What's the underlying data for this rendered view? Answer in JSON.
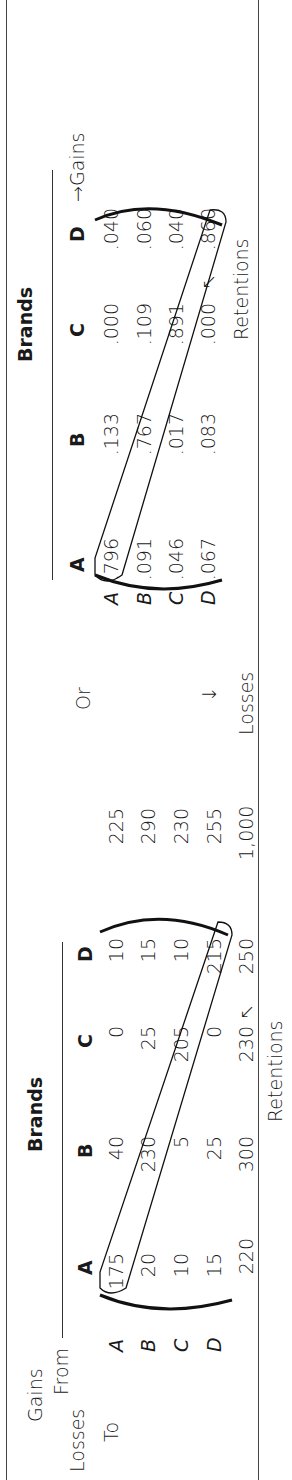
{
  "left_table": {
    "gains_label": "Gains",
    "from_label": "From",
    "losses_label": "Losses",
    "to_label": "To",
    "brands_label": "Brands",
    "column_headers": [
      "A",
      "B",
      "C",
      "D"
    ],
    "row_labels": [
      "A",
      "B",
      "C",
      "D"
    ],
    "rows": [
      {
        "values": [
          "175",
          "40",
          "0",
          "10"
        ],
        "total": "225"
      },
      {
        "values": [
          "20",
          "230",
          "25",
          "15"
        ],
        "total": "290"
      },
      {
        "values": [
          "10",
          "5",
          "205",
          "10"
        ],
        "total": "230"
      },
      {
        "values": [
          "15",
          "25",
          "0",
          "215"
        ],
        "total": "255"
      }
    ],
    "column_totals": [
      "220",
      "300",
      "230",
      "250"
    ],
    "grand_total": "1,000",
    "retentions_label": "Retentions",
    "retentions_arrow": "↖"
  },
  "connector": {
    "or_label": "Or",
    "losses_arrow": "↓",
    "losses_label": "Losses"
  },
  "right_table": {
    "brands_label": "Brands",
    "column_headers": [
      "A",
      "B",
      "C",
      "D"
    ],
    "gains_label": "→Gains",
    "row_labels": [
      "A",
      "B",
      "C",
      "D"
    ],
    "rows": [
      {
        "values": [
          ".796",
          ".133",
          ".000",
          ".040"
        ]
      },
      {
        "values": [
          ".091",
          ".767",
          ".109",
          ".060"
        ]
      },
      {
        "values": [
          ".046",
          ".017",
          ".891",
          ".040"
        ]
      },
      {
        "values": [
          ".067",
          ".083",
          ".000",
          ".860"
        ]
      }
    ],
    "retentions_label": "Retentions",
    "retentions_arrow": "↖"
  }
}
